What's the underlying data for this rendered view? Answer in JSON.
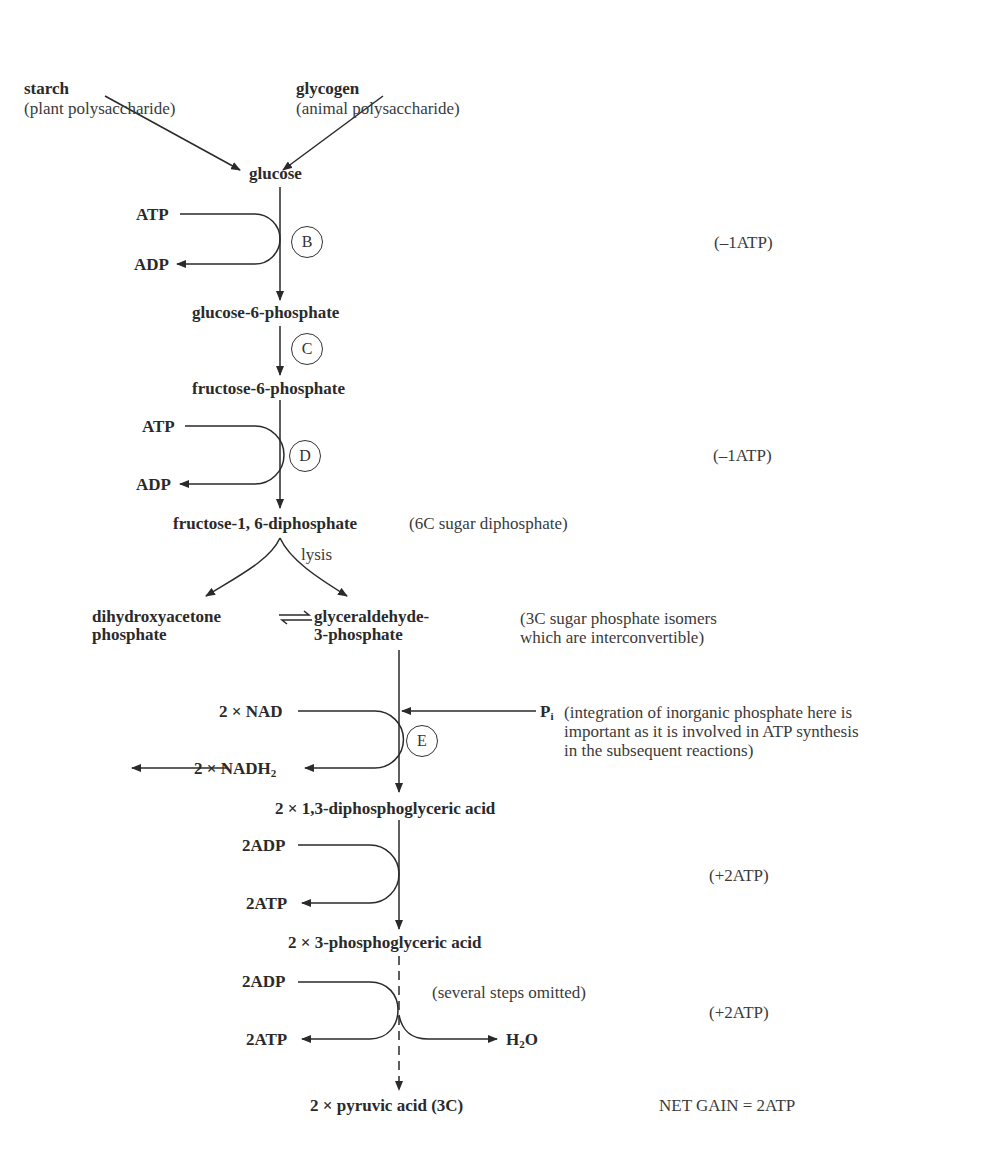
{
  "sources": {
    "starch": {
      "name": "starch",
      "note": "(plant polysaccharide)"
    },
    "glycogen": {
      "name": "glycogen",
      "note": "(animal polysaccharide)"
    }
  },
  "metabolites": {
    "glucose": "glucose",
    "g6p": "glucose-6-phosphate",
    "f6p": "fructose-6-phosphate",
    "f16dp": "fructose-1, 6-diphosphate",
    "dhap_1": "dihydroxyacetone",
    "dhap_2": "phosphate",
    "g3p_1": "glyceraldehyde-",
    "g3p_2": "3-phosphate",
    "dpg": "2 × 1,3-diphosphoglyceric acid",
    "pg3": "2 × 3-phosphoglyceric acid",
    "pyruvate": "2 × pyruvic acid (3C)"
  },
  "cofactors": {
    "step_b": {
      "in": "ATP",
      "out": "ADP",
      "enzyme": "B"
    },
    "step_c": {
      "enzyme": "C"
    },
    "step_d": {
      "in": "ATP",
      "out": "ADP",
      "enzyme": "D"
    },
    "step_e": {
      "in": "2 × NAD",
      "out_prefix": "2 × NADH",
      "out_sub": "2",
      "enzyme": "E",
      "pi": "P",
      "pi_sub": "i"
    },
    "step_f": {
      "in": "2ADP",
      "out": "2ATP"
    },
    "step_g": {
      "in": "2ADP",
      "out": "2ATP",
      "water_main": "H",
      "water_sub": "2",
      "water_end": "O"
    }
  },
  "annotations": {
    "lysis": "lysis",
    "f16dp_note": "(6C sugar diphosphate)",
    "isomers_1": "(3C sugar phosphate isomers",
    "isomers_2": "which are interconvertible)",
    "pi_note_1": "(integration of inorganic phosphate here is",
    "pi_note_2": "important as it is involved in ATP synthesis",
    "pi_note_3": "in the subsequent reactions)",
    "omitted": "(several steps omitted)"
  },
  "atp_balance": {
    "b": "(–1ATP)",
    "d": "(–1ATP)",
    "f": "(+2ATP)",
    "g": "(+2ATP)",
    "net": "NET GAIN = 2ATP"
  }
}
